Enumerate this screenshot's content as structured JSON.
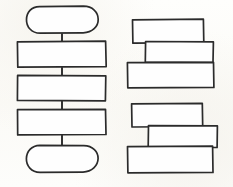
{
  "diagram": {
    "style": {
      "background_color": "#fdfdfb",
      "ink_color": "#2b2b2b",
      "shape_fill": "#fefefe"
    },
    "left_flowchart": {
      "name": "vertical flowchart",
      "nodes": [
        {
          "id": "start",
          "shape": "stadium",
          "label": "",
          "x": 27,
          "y": 7,
          "w": 71,
          "h": 26
        },
        {
          "id": "step-1",
          "shape": "rectangle",
          "label": "",
          "x": 18,
          "y": 42,
          "w": 88,
          "h": 25
        },
        {
          "id": "step-2",
          "shape": "rectangle",
          "label": "",
          "x": 18,
          "y": 76,
          "w": 88,
          "h": 25
        },
        {
          "id": "step-3",
          "shape": "rectangle",
          "label": "",
          "x": 18,
          "y": 110,
          "w": 88,
          "h": 25
        },
        {
          "id": "end",
          "shape": "stadium",
          "label": "",
          "x": 27,
          "y": 146,
          "w": 71,
          "h": 26
        }
      ],
      "connectors": [
        {
          "id": "start-to-step-1",
          "x": 61,
          "y": 33,
          "length": 9
        },
        {
          "id": "step-1-to-step-2",
          "x": 61,
          "y": 67,
          "length": 9
        },
        {
          "id": "step-2-to-step-3",
          "x": 61,
          "y": 101,
          "length": 9
        },
        {
          "id": "step-3-to-end",
          "x": 61,
          "y": 135,
          "length": 11
        }
      ]
    },
    "right_group_upper": {
      "name": "upper stacked blocks",
      "blocks": [
        {
          "id": "upper-block-1",
          "label": "",
          "x": 133,
          "y": 20,
          "w": 71,
          "h": 23
        },
        {
          "id": "upper-block-2",
          "label": "",
          "x": 146,
          "y": 42,
          "w": 68,
          "h": 21
        },
        {
          "id": "upper-block-3",
          "label": "",
          "x": 128,
          "y": 63,
          "w": 86,
          "h": 25
        }
      ]
    },
    "right_group_lower": {
      "name": "lower stacked blocks",
      "blocks": [
        {
          "id": "lower-block-1",
          "label": "",
          "x": 132,
          "y": 104,
          "w": 71,
          "h": 23
        },
        {
          "id": "lower-block-2",
          "label": "",
          "x": 149,
          "y": 126,
          "w": 69,
          "h": 22
        },
        {
          "id": "lower-block-3",
          "label": "",
          "x": 128,
          "y": 147,
          "w": 85,
          "h": 26
        }
      ]
    }
  }
}
